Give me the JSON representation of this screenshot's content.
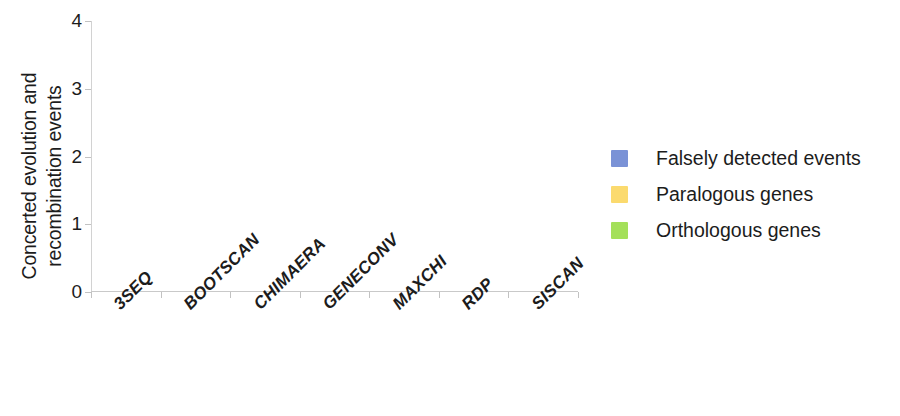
{
  "chart_data": {
    "type": "bar",
    "title": "",
    "subtitle": "",
    "xlabel": "",
    "ylabel": "Concerted evolution and recombination events",
    "ylabel_lines": [
      "Concerted evolution and",
      "recombination events"
    ],
    "categories": [
      "3SEQ",
      "BOOTSCAN",
      "CHIMAERA",
      "GENECONV",
      "MAXCHI",
      "RDP",
      "SISCAN"
    ],
    "series": [
      {
        "name": "Falsely detected events",
        "color": "#7a92d6",
        "values": [
          0,
          0,
          0,
          0,
          0,
          0,
          0
        ]
      },
      {
        "name": "Paralogous genes",
        "color": "#fbda6e",
        "values": [
          0,
          0,
          0,
          0,
          0,
          0,
          0
        ]
      },
      {
        "name": "Orthologous genes",
        "color": "#a4e05a",
        "values": [
          0,
          0,
          0,
          0,
          0,
          0,
          0
        ]
      }
    ],
    "ylim": [
      0,
      4
    ],
    "yticks": [
      0,
      1,
      2,
      3,
      4
    ],
    "ytick_labels": [
      "0",
      "1",
      "2",
      "3",
      "4"
    ],
    "grid": false,
    "legend_position": "right",
    "axis_color": "#c9c9c9",
    "background_color": "#ffffff"
  },
  "legend": {
    "items": [
      {
        "label": "Falsely detected events",
        "color": "#7a92d6"
      },
      {
        "label": "Paralogous genes",
        "color": "#fbda6e"
      },
      {
        "label": "Orthologous genes",
        "color": "#a4e05a"
      }
    ]
  }
}
